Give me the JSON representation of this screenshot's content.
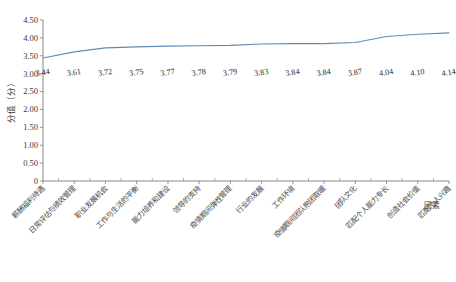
{
  "chart_data": {
    "type": "line",
    "title": "",
    "xlabel": "因素",
    "ylabel": "分值（分）",
    "ylim": [
      0,
      4.5
    ],
    "ytick_labels": [
      "0",
      "0.50",
      "1.00",
      "1.50",
      "2.00",
      "2.50",
      "3.00",
      "3.50",
      "4.00",
      "4.50"
    ],
    "ytick_values": [
      0,
      0.5,
      1.0,
      1.5,
      2.0,
      2.5,
      3.0,
      3.5,
      4.0,
      4.5
    ],
    "grid": false,
    "legend": "none",
    "categories": [
      "薪酬福利待遇",
      "日常评估与绩效管理",
      "职业发展机会",
      "工作与生活的平衡",
      "能力培养和建设",
      "领导的支持",
      "疫情期间弹性管理",
      "行业的发展",
      "工作环境",
      "疫情期间团队抱团取暖",
      "团队文化",
      "匹配个人能力专长",
      "创造社会价值",
      "匹配个人兴趣"
    ],
    "values": [
      3.44,
      3.61,
      3.72,
      3.75,
      3.77,
      3.78,
      3.79,
      3.83,
      3.84,
      3.84,
      3.87,
      4.04,
      4.1,
      4.14
    ],
    "data_labels": [
      "3.44",
      "3.61",
      "3.72",
      "3.75",
      "3.77",
      "3.78",
      "3.79",
      "3.83",
      "3.84",
      "3.84",
      "3.87",
      "4.04",
      "4.10",
      "4.14"
    ],
    "series_color": "#5b8db8",
    "axis_color": "#6b6b6b",
    "background": "#ffffff"
  }
}
